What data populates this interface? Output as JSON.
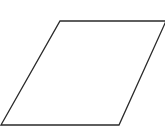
{
  "diagram": {
    "shape": "parallelogram",
    "stroke_color": "#2a2a2a",
    "fill_color": "#ffffff",
    "stroke_width": 1.3,
    "points": "60,21 166,21 119,125 1,125"
  }
}
